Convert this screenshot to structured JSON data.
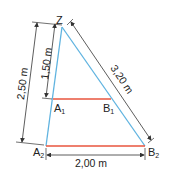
{
  "diagram": {
    "points": {
      "Z": {
        "label": "Z",
        "x": 62,
        "y": 27
      },
      "A1": {
        "label": "A",
        "sub": "1",
        "x": 53,
        "y": 99
      },
      "B1": {
        "label": "B",
        "sub": "1",
        "x": 111,
        "y": 99
      },
      "A2": {
        "label": "A",
        "sub": "2",
        "x": 46,
        "y": 146
      },
      "B2": {
        "label": "B",
        "sub": "2",
        "x": 145,
        "y": 146
      }
    },
    "dimensions": {
      "outer_vertical": "2,50 m",
      "inner_vertical": "1,50 m",
      "slant": "3,20 m",
      "bottom": "2,00 m"
    },
    "colors": {
      "side_lines": "#5fb3e0",
      "horizontal_lines": "#e8553e",
      "dimension_lines": "#333333"
    }
  }
}
